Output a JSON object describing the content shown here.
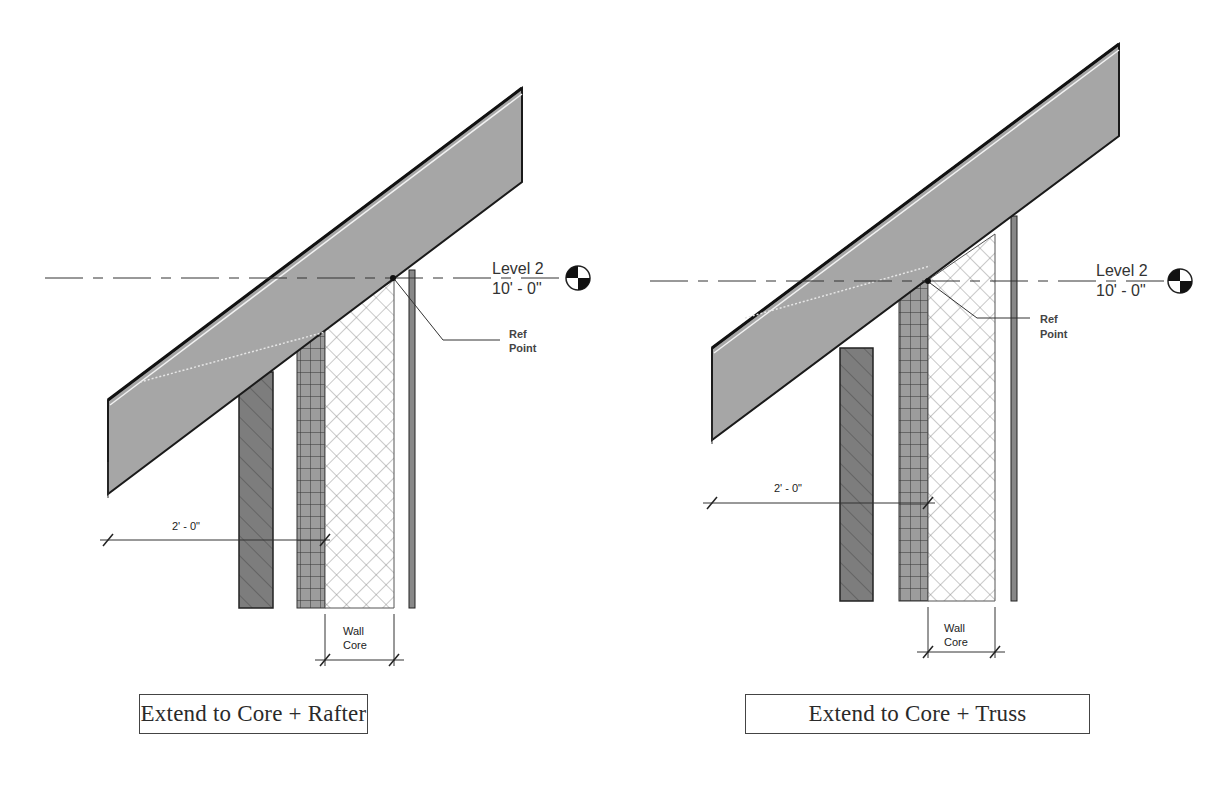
{
  "figures": [
    {
      "id": "rafter",
      "caption": "Extend to Core + Rafter",
      "level": {
        "name": "Level 2",
        "elevation": "10' - 0\""
      },
      "ref_point_label": [
        "Ref",
        "Point"
      ],
      "overhang_dimension": "2' - 0\"",
      "wall_core_label": [
        "Wall",
        "Core"
      ]
    },
    {
      "id": "truss",
      "caption": "Extend to Core + Truss",
      "level": {
        "name": "Level 2",
        "elevation": "10' - 0\""
      },
      "ref_point_label": [
        "Ref",
        "Point"
      ],
      "overhang_dimension": "2' - 0\"",
      "wall_core_label": [
        "Wall",
        "Core"
      ]
    }
  ],
  "colors": {
    "roof_fill": "#a8a8a8",
    "roof_edge": "#1a1a1a",
    "brick_fill": "#7a7a7a",
    "grid_fill": "#9a9a9a",
    "insulation_line": "#666666",
    "line": "#222222"
  }
}
